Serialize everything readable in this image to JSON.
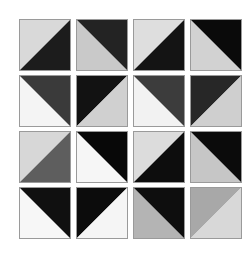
{
  "figure": {
    "title": "",
    "background_color": "#ffffff",
    "border_color": "#9a9a9a",
    "grid": {
      "rows": 4,
      "columns": 4,
      "tile_size_px": 52,
      "column_gap_px": 5,
      "row_gap_px": 4,
      "origin_x_px": 19,
      "origin_y_px": 19
    }
  },
  "tiles": [
    {
      "id": "tile-r1c1",
      "row": 1,
      "column": 1,
      "diagonal": "tl-br",
      "upper_left_color": "#d9d9d9",
      "lower_right_color": "#1c1c1c",
      "description": "light gray upper-left, near-black lower-right"
    },
    {
      "id": "tile-r1c2",
      "row": 1,
      "column": 2,
      "diagonal": "bl-tr",
      "upper_left_color": "#c9c9c9",
      "lower_right_color": "#232323",
      "description": "light gray lower-left, near-black upper-right"
    },
    {
      "id": "tile-r1c3",
      "row": 1,
      "column": 3,
      "diagonal": "tl-br",
      "upper_left_color": "#dedede",
      "lower_right_color": "#141414",
      "description": "light gray upper-left, black lower-right"
    },
    {
      "id": "tile-r1c4",
      "row": 1,
      "column": 4,
      "diagonal": "bl-tr",
      "upper_left_color": "#d2d2d2",
      "lower_right_color": "#0a0a0a",
      "description": "light gray lower-left, black upper-right"
    },
    {
      "id": "tile-r2c1",
      "row": 2,
      "column": 1,
      "diagonal": "bl-tr",
      "upper_left_color": "#f4f4f4",
      "lower_right_color": "#3a3a3a",
      "description": "white upper-right, dark gray lower-left"
    },
    {
      "id": "tile-r2c2",
      "row": 2,
      "column": 2,
      "diagonal": "tl-br",
      "upper_left_color": "#121212",
      "lower_right_color": "#d0d0d0",
      "description": "black upper-left, light gray lower-right"
    },
    {
      "id": "tile-r2c3",
      "row": 2,
      "column": 3,
      "diagonal": "bl-tr",
      "upper_left_color": "#f2f2f2",
      "lower_right_color": "#3c3c3c",
      "description": "white upper-right, dark gray lower-left"
    },
    {
      "id": "tile-r2c4",
      "row": 2,
      "column": 4,
      "diagonal": "tl-br",
      "upper_left_color": "#272727",
      "lower_right_color": "#cfcfcf",
      "description": "dark gray upper-left, light gray lower-right"
    },
    {
      "id": "tile-r3c1",
      "row": 3,
      "column": 1,
      "diagonal": "tl-br",
      "upper_left_color": "#d7d7d7",
      "lower_right_color": "#5e5e5e",
      "description": "light gray upper-left, medium gray lower-right"
    },
    {
      "id": "tile-r3c2",
      "row": 3,
      "column": 2,
      "diagonal": "bl-tr",
      "upper_left_color": "#f6f6f6",
      "lower_right_color": "#080808",
      "description": "white lower-left, black upper-right"
    },
    {
      "id": "tile-r3c3",
      "row": 3,
      "column": 3,
      "diagonal": "tl-br",
      "upper_left_color": "#dcdcdc",
      "lower_right_color": "#0d0d0d",
      "description": "light gray upper-left, black lower-right"
    },
    {
      "id": "tile-r3c4",
      "row": 3,
      "column": 4,
      "diagonal": "bl-tr",
      "upper_left_color": "#c6c6c6",
      "lower_right_color": "#0b0b0b",
      "description": "light gray lower-left, black upper-right"
    },
    {
      "id": "tile-r4c1",
      "row": 4,
      "column": 1,
      "diagonal": "bl-tr",
      "upper_left_color": "#f7f7f7",
      "lower_right_color": "#101010",
      "description": "white upper-right, black lower-left"
    },
    {
      "id": "tile-r4c2",
      "row": 4,
      "column": 2,
      "diagonal": "tl-br",
      "upper_left_color": "#0c0c0c",
      "lower_right_color": "#f5f5f5",
      "description": "black upper-left, white lower-right"
    },
    {
      "id": "tile-r4c3",
      "row": 4,
      "column": 3,
      "diagonal": "bl-tr",
      "upper_left_color": "#b4b4b4",
      "lower_right_color": "#0e0e0e",
      "description": "medium gray upper-right, black lower-left"
    },
    {
      "id": "tile-r4c4",
      "row": 4,
      "column": 4,
      "diagonal": "tl-br",
      "upper_left_color": "#a8a8a8",
      "lower_right_color": "#d8d8d8",
      "description": "medium gray upper-left, light gray lower-right"
    }
  ]
}
